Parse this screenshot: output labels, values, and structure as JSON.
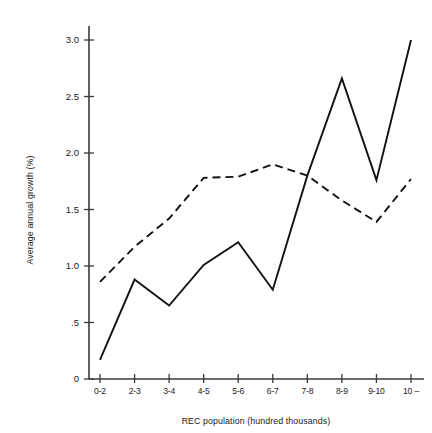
{
  "chart_data": {
    "type": "line",
    "title": "",
    "xlabel": "REC population (hundred thousands)",
    "ylabel": "Average annual growth (%)",
    "categories": [
      "0-2",
      "2-3",
      "3-4",
      "4-5",
      "5-6",
      "6-7",
      "7-8",
      "8-9",
      "9-10",
      "10 –"
    ],
    "series": [
      {
        "name": "solid-series",
        "style": "solid",
        "values": [
          0.17,
          0.88,
          0.65,
          1.01,
          1.21,
          0.79,
          1.8,
          2.66,
          1.76,
          3.0
        ]
      },
      {
        "name": "dashed-series",
        "style": "dashed",
        "values": [
          0.86,
          1.17,
          1.42,
          1.78,
          1.79,
          1.9,
          1.8,
          1.58,
          1.39,
          1.77
        ]
      }
    ],
    "ylim": [
      0,
      3.15
    ],
    "ytick_values": [
      0,
      0.5,
      1.0,
      1.5,
      2.0,
      2.5,
      3.0
    ],
    "ytick_labels": [
      "0",
      ".5",
      "1.0",
      "1.5",
      "2.0",
      "2.5",
      "3.0"
    ],
    "grid": false,
    "legend": null,
    "legend_position": "none"
  },
  "colors": {
    "background": "#ffffff",
    "axis": "#3a3a3a",
    "line": "#111111",
    "text": "#1a1a1a"
  }
}
